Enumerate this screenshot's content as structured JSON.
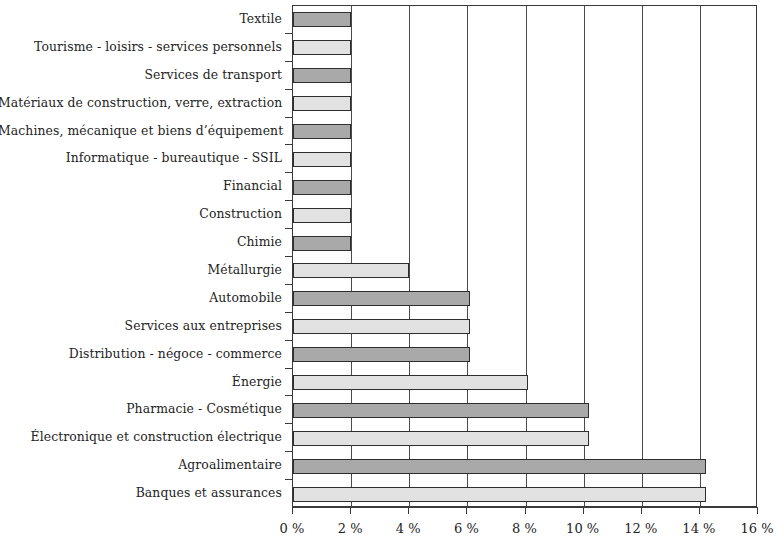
{
  "chart_data": {
    "type": "bar",
    "orientation": "horizontal",
    "title": "",
    "subtitle": "",
    "xlabel": "",
    "ylabel": "",
    "xlim": [
      0,
      16
    ],
    "xticks": [
      0,
      2,
      4,
      6,
      8,
      10,
      12,
      14,
      16
    ],
    "xtick_labels": [
      "0 %",
      "2 %",
      "4 %",
      "6 %",
      "8 %",
      "10 %",
      "12 %",
      "14 %",
      "16 %"
    ],
    "grid": true,
    "grid_axis": "x",
    "legend": null,
    "unit": "%",
    "bar_colors": {
      "dark": "#a9a9a9",
      "light": "#e2e2e2",
      "outline": "#2e2e2e"
    },
    "categories": [
      "Textile",
      "Tourisme - loisirs - services personnels",
      "Services de transport",
      "Matériaux de construction, verre, extraction",
      "Machines, mécanique et biens d’équipement",
      "Informatique - bureautique - SSIL",
      "Financial",
      "Construction",
      "Chimie",
      "Métallurgie",
      "Automobile",
      "Services aux entreprises",
      "Distribution - négoce - commerce",
      "Énergie",
      "Pharmacie - Cosmétique",
      "Électronique et construction électrique",
      "Agroalimentaire",
      "Banques et assurances"
    ],
    "values": [
      2.0,
      2.0,
      2.0,
      2.0,
      2.0,
      2.0,
      2.0,
      2.0,
      2.0,
      4.0,
      6.1,
      6.1,
      6.1,
      8.1,
      10.2,
      10.2,
      14.2,
      14.2
    ],
    "shades": [
      "dark",
      "light",
      "dark",
      "light",
      "dark",
      "light",
      "dark",
      "light",
      "dark",
      "light",
      "dark",
      "light",
      "dark",
      "light",
      "dark",
      "light",
      "dark",
      "light"
    ]
  }
}
